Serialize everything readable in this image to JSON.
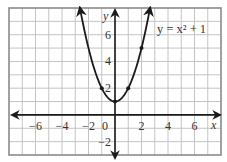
{
  "chart_data": {
    "type": "line",
    "title": "",
    "equation_label": "y = x² + 1",
    "xlabel": "x",
    "ylabel": "y",
    "xlim": [
      -8,
      8
    ],
    "ylim": [
      -3,
      8
    ],
    "grid": true,
    "grid_step": 1,
    "x_ticks": [
      -6,
      -4,
      -2,
      0,
      2,
      4,
      6
    ],
    "x_tick_labels": [
      "−6",
      "−4",
      "−2",
      "0",
      "2",
      "4",
      "6"
    ],
    "y_ticks": [
      -2,
      2,
      4,
      6
    ],
    "y_tick_labels": [
      "−2",
      "2",
      "4",
      "6"
    ],
    "series": [
      {
        "name": "y = x² + 1",
        "function": "x^2 + 1",
        "domain": [
          -2.65,
          2.65
        ],
        "arrows": "both ends",
        "marked_points": [
          {
            "x": -1,
            "y": 2
          },
          {
            "x": 0,
            "y": 1
          },
          {
            "x": 1,
            "y": 2
          },
          {
            "x": 2,
            "y": 5
          }
        ]
      }
    ]
  }
}
